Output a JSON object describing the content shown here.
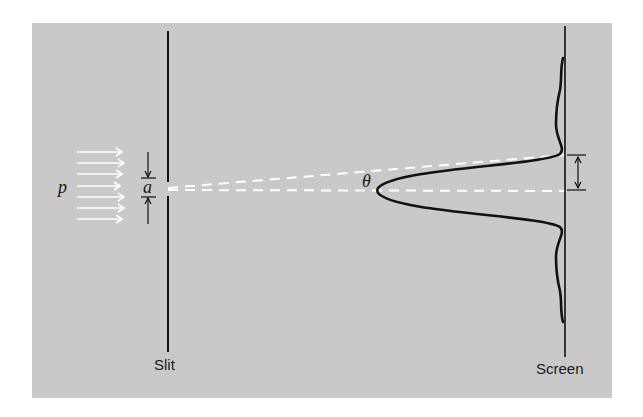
{
  "diagram": {
    "labels": {
      "momentum": "p",
      "slit_width": "a",
      "angle": "θ",
      "slit": "Slit",
      "screen": "Screen"
    },
    "colors": {
      "background": "#c9c9c9",
      "lines": "#111111",
      "dashes": "#ffffff",
      "arrows": "#ffffff"
    },
    "elements": [
      "incident plane-wave arrows (7)",
      "slit barrier with gap of width a",
      "dashed center line and first-minimum line at angle θ",
      "central diffraction peak with side lobes along screen",
      "dimension arrow on screen between center and first minimum"
    ]
  }
}
